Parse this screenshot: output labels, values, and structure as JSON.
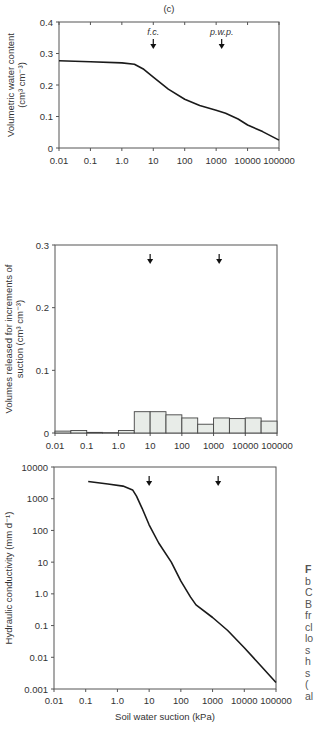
{
  "chart_data": [
    {
      "type": "line",
      "panel_label": "(c)",
      "title": "",
      "xlabel": "",
      "ylabel_lines": [
        "Volumetric water content",
        "(cm³ cm⁻³)"
      ],
      "xscale": "log",
      "xlim": [
        0.01,
        100000
      ],
      "ylim": [
        0,
        0.4
      ],
      "xticks": [
        "0.01",
        "0.1",
        "1.0",
        "10",
        "100",
        "1000",
        "10000",
        "100000"
      ],
      "yticks": [
        "0",
        "0.1",
        "0.2",
        "0.3",
        "0.4"
      ],
      "annotations": [
        {
          "label": "f.c.",
          "x": 10
        },
        {
          "label": "p.w.p.",
          "x": 1500
        }
      ],
      "series": [
        {
          "name": "water retention",
          "x": [
            0.01,
            0.1,
            1,
            2.5,
            5,
            10,
            30,
            100,
            300,
            1000,
            2000,
            5000,
            10000,
            30000,
            100000
          ],
          "y": [
            0.277,
            0.274,
            0.27,
            0.266,
            0.25,
            0.225,
            0.187,
            0.155,
            0.135,
            0.12,
            0.11,
            0.092,
            0.073,
            0.052,
            0.025
          ]
        }
      ]
    },
    {
      "type": "bar",
      "title": "",
      "xlabel": "",
      "ylabel_lines": [
        "Volumes released for increments of",
        "suction  (cm³ cm⁻³)"
      ],
      "xscale": "log",
      "xlim": [
        0.01,
        100000
      ],
      "ylim": [
        0,
        0.3
      ],
      "xticks": [
        "0.01",
        "0.1",
        "1.0",
        "10",
        "100",
        "1000",
        "10000",
        "100000"
      ],
      "yticks": [
        "0",
        "0.1",
        "0.2",
        "0.3"
      ],
      "annotations": [
        {
          "label": "",
          "x": 10
        },
        {
          "label": "",
          "x": 1500
        }
      ],
      "bin_edges": [
        0.01,
        0.0316,
        0.1,
        0.316,
        1,
        3.16,
        10,
        31.6,
        100,
        316,
        1000,
        3160,
        10000,
        31600,
        100000
      ],
      "values": [
        0.003,
        0.004,
        0.001,
        0.0005,
        0.004,
        0.034,
        0.034,
        0.029,
        0.024,
        0.014,
        0.024,
        0.023,
        0.024,
        0.019
      ]
    },
    {
      "type": "line",
      "title": "",
      "xlabel": "Soil water suction (kPa)",
      "ylabel_lines": [
        "Hydraulic conductivity (mm d⁻¹)"
      ],
      "xscale": "log",
      "yscale": "log",
      "xlim": [
        0.01,
        100000
      ],
      "ylim": [
        0.001,
        10000
      ],
      "xticks": [
        "0.01",
        "0.1",
        "1.0",
        "10",
        "100",
        "1000",
        "10000",
        "100000"
      ],
      "yticks": [
        "0.001",
        "0.01",
        "0.1",
        "1.0",
        "10",
        "100",
        "1000",
        "10000"
      ],
      "annotations": [
        {
          "label": "",
          "x": 10
        },
        {
          "label": "",
          "x": 1500
        }
      ],
      "series": [
        {
          "name": "hydraulic conductivity",
          "x": [
            0.12,
            0.5,
            1.5,
            3,
            4,
            6,
            10,
            20,
            50,
            100,
            200,
            300,
            1000,
            3000,
            10000,
            30000,
            100000
          ],
          "y": [
            3500,
            2900,
            2500,
            1900,
            1200,
            500,
            150,
            40,
            10,
            2.5,
            0.8,
            0.45,
            0.18,
            0.07,
            0.02,
            0.006,
            0.0016
          ]
        }
      ]
    }
  ],
  "caption_fragment": [
    "F",
    "b",
    "C",
    "B",
    "fr",
    "cl",
    "lo",
    "s",
    "h",
    "s",
    "(",
    "al"
  ]
}
